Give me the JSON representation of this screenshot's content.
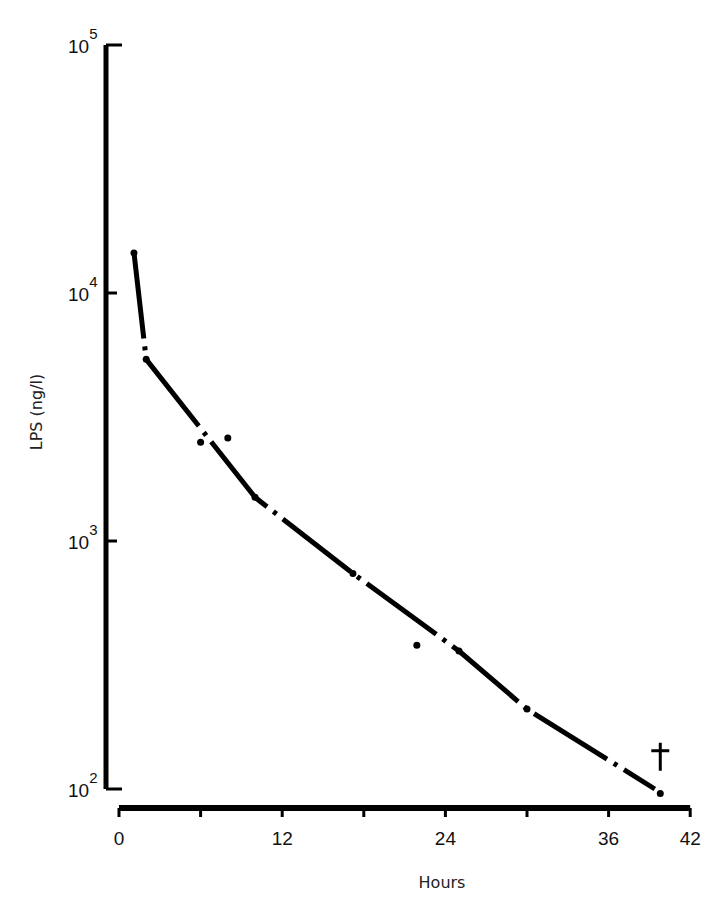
{
  "chart_data": {
    "type": "line",
    "title": "",
    "xlabel": "Hours",
    "ylabel": "LPS (ng/l)",
    "yscale": "log",
    "ylim": [
      100,
      100000
    ],
    "xlim": [
      0,
      42
    ],
    "grid": false,
    "legend": null,
    "x_ticks": [
      0,
      6,
      12,
      18,
      24,
      30,
      36,
      42
    ],
    "x_tick_labels": [
      "0",
      "",
      "12",
      "",
      "24",
      "",
      "36",
      "42"
    ],
    "y_ticks": [
      100,
      1000,
      10000,
      100000
    ],
    "y_tick_labels": [
      {
        "base": "10",
        "exp": "2"
      },
      {
        "base": "10",
        "exp": "3"
      },
      {
        "base": "10",
        "exp": "4"
      },
      {
        "base": "10",
        "exp": "5"
      }
    ],
    "series": [
      {
        "name": "LPS measurements",
        "style": "points",
        "x": [
          1.1,
          2.0,
          6.0,
          8.0,
          10.0,
          17.2,
          21.9,
          25.0,
          30.0,
          39.8
        ],
        "y": [
          14500,
          5400,
          2500,
          2600,
          1500,
          740,
          380,
          360,
          210,
          96
        ]
      },
      {
        "name": "Fitted decay curve",
        "style": "dash-dot line",
        "x": [
          1.1,
          2.0,
          10.0,
          17.2,
          25.0,
          30.0,
          39.4
        ],
        "y": [
          14500,
          5400,
          1500,
          740,
          360,
          210,
          100
        ]
      }
    ],
    "annotations": [
      {
        "text": "†",
        "x": 39.8,
        "y": 130,
        "meaning": "death"
      }
    ]
  }
}
